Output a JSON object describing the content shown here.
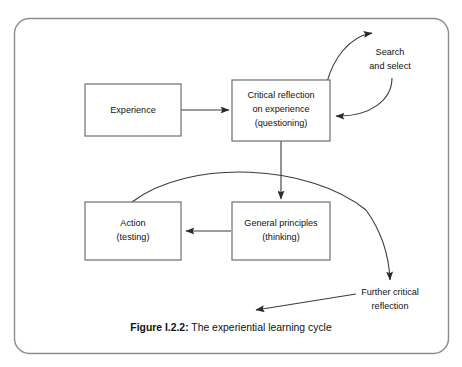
{
  "figure": {
    "caption_label": "Figure I.2.2:",
    "caption_text": "The experiential learning cycle",
    "frame_color": "#8c8c8c",
    "box_border_color": "#6e6e6e",
    "arrow_color": "#3a3a3a",
    "background": "#ffffff"
  },
  "nodes": [
    {
      "id": "experience",
      "lines": [
        "Experience"
      ],
      "line1": "Experience",
      "line2": "",
      "line3": ""
    },
    {
      "id": "critical-reflection",
      "lines": [
        "Critical reflection",
        "on experience",
        "(questioning)"
      ],
      "line1": "Critical reflection",
      "line2": "on experience",
      "line3": "(questioning)"
    },
    {
      "id": "action",
      "lines": [
        "Action",
        "(testing)"
      ],
      "line1": "Action",
      "line2": "(testing)",
      "line3": ""
    },
    {
      "id": "general-principles",
      "lines": [
        "General principles",
        "(thinking)"
      ],
      "line1": "General principles",
      "line2": "(thinking)",
      "line3": ""
    }
  ],
  "free_labels": [
    {
      "id": "search-and-select",
      "line1": "Search",
      "line2": "and select"
    },
    {
      "id": "further-critical-reflection",
      "line1": "Further critical",
      "line2": "reflection"
    }
  ],
  "connectors": [
    {
      "id": "experience-to-reflection",
      "kind": "straight-arrow"
    },
    {
      "id": "reflection-to-search",
      "kind": "curved-arrow"
    },
    {
      "id": "search-to-reflection",
      "kind": "curved-arrow"
    },
    {
      "id": "reflection-to-principles",
      "kind": "straight-arrow"
    },
    {
      "id": "principles-to-action",
      "kind": "straight-arrow"
    },
    {
      "id": "action-to-further-reflection",
      "kind": "curved-arrow"
    },
    {
      "id": "further-reflection-to-cycle",
      "kind": "straight-arrow"
    }
  ]
}
